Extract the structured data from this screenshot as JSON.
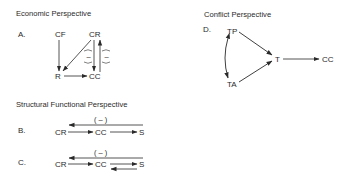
{
  "panels": {
    "economic": {
      "title": "Economic Perspective",
      "label": "A.",
      "nodes": {
        "cf": "CF",
        "cr": "CR",
        "r": "R",
        "cc": "CC"
      },
      "edges": [
        {
          "from": "CF",
          "to": "R"
        },
        {
          "from": "CR",
          "to": "R"
        },
        {
          "from": "CR",
          "to": "CC",
          "sign": "–"
        },
        {
          "from": "CC",
          "to": "CR",
          "sign": "–"
        },
        {
          "from": "R",
          "to": "CC"
        }
      ],
      "sign1": "–",
      "sign2": "–"
    },
    "conflict": {
      "title": "Conflict Perspective",
      "label": "D.",
      "nodes": {
        "tp": "TP",
        "t": "T",
        "ta": "TA",
        "cc": "CC"
      },
      "edges": [
        {
          "from": "TP",
          "to": "T"
        },
        {
          "from": "TA",
          "to": "T"
        },
        {
          "from": "TP",
          "to": "TA",
          "bidirectional": true
        },
        {
          "from": "T",
          "to": "CC"
        }
      ]
    },
    "structural": {
      "title": "Structural Functional Perspective",
      "b": {
        "label": "B.",
        "nodes": {
          "cr": "CR",
          "cc": "CC",
          "s": "S"
        },
        "feedback_sign": "( – )",
        "edges": [
          {
            "from": "CR",
            "to": "CC"
          },
          {
            "from": "CC",
            "to": "S"
          },
          {
            "from": "S",
            "to": "CR",
            "sign": "–"
          }
        ]
      },
      "c": {
        "label": "C.",
        "nodes": {
          "cr": "CR",
          "cc": "CC",
          "s": "S"
        },
        "feedback_sign": "( – )",
        "edges": [
          {
            "from": "CR",
            "to": "CC"
          },
          {
            "from": "CC",
            "to": "S"
          },
          {
            "from": "S",
            "to": "CC"
          },
          {
            "from": "S",
            "to": "CR",
            "sign": "–"
          }
        ]
      }
    }
  }
}
